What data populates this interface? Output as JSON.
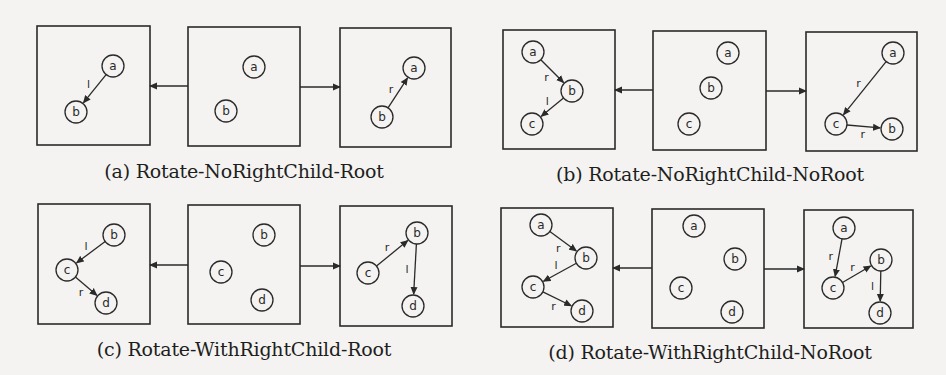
{
  "figure": {
    "colors": {
      "ink": "#2a2a2a",
      "background": "#f4f3f1"
    },
    "subfigures": [
      {
        "id": "a",
        "caption": "(a) Rotate-NoRightChild-Root",
        "caption_pos": [
          244,
          174
        ],
        "panels": [
          {
            "box": [
              37,
              26,
              113,
              119
            ],
            "nodes": [
              {
                "label": "a",
                "x": 113,
                "y": 66
              },
              {
                "label": "b",
                "x": 76,
                "y": 112
              }
            ],
            "edges": [
              {
                "from": "a",
                "to": "b",
                "label": "l"
              }
            ]
          },
          {
            "box": [
              188,
              27,
              112,
              119
            ],
            "nodes": [
              {
                "label": "a",
                "x": 254,
                "y": 67
              },
              {
                "label": "b",
                "x": 226,
                "y": 111
              }
            ],
            "edges": []
          },
          {
            "box": [
              340,
              28,
              111,
              119
            ],
            "nodes": [
              {
                "label": "a",
                "x": 414,
                "y": 68
              },
              {
                "label": "b",
                "x": 382,
                "y": 117
              }
            ],
            "edges": [
              {
                "from": "b",
                "to": "a",
                "label": "r"
              }
            ]
          }
        ],
        "transitions": [
          {
            "x1": 188,
            "x2": 150,
            "y": 86
          },
          {
            "x1": 300,
            "x2": 340,
            "y": 87
          }
        ]
      },
      {
        "id": "b",
        "caption": "(b) Rotate-NoRightChild-NoRoot",
        "caption_pos": [
          710,
          177
        ],
        "panels": [
          {
            "box": [
              503,
              30,
              112,
              119
            ],
            "nodes": [
              {
                "label": "a",
                "x": 533,
                "y": 52
              },
              {
                "label": "b",
                "x": 572,
                "y": 91
              },
              {
                "label": "c",
                "x": 532,
                "y": 124
              }
            ],
            "edges": [
              {
                "from": "a",
                "to": "b",
                "label": "r"
              },
              {
                "from": "b",
                "to": "c",
                "label": "l"
              }
            ]
          },
          {
            "box": [
              653,
              31,
              113,
              119
            ],
            "nodes": [
              {
                "label": "a",
                "x": 728,
                "y": 53
              },
              {
                "label": "b",
                "x": 711,
                "y": 88
              },
              {
                "label": "c",
                "x": 689,
                "y": 124
              }
            ],
            "edges": []
          },
          {
            "box": [
              806,
              32,
              111,
              119
            ],
            "nodes": [
              {
                "label": "a",
                "x": 893,
                "y": 53
              },
              {
                "label": "c",
                "x": 836,
                "y": 124
              },
              {
                "label": "b",
                "x": 892,
                "y": 129
              }
            ],
            "edges": [
              {
                "from": "a",
                "to": "c",
                "label": "r"
              },
              {
                "from": "c",
                "to": "b",
                "label": "r"
              }
            ]
          }
        ],
        "transitions": [
          {
            "x1": 653,
            "x2": 615,
            "y": 90
          },
          {
            "x1": 766,
            "x2": 806,
            "y": 91
          }
        ]
      },
      {
        "id": "c",
        "caption": "(c) Rotate-WithRightChild-Root",
        "caption_pos": [
          244,
          352
        ],
        "panels": [
          {
            "box": [
              38,
              204,
              112,
              120
            ],
            "nodes": [
              {
                "label": "b",
                "x": 114,
                "y": 235
              },
              {
                "label": "c",
                "x": 67,
                "y": 270
              },
              {
                "label": "d",
                "x": 106,
                "y": 303
              }
            ],
            "edges": [
              {
                "from": "b",
                "to": "c",
                "label": "l"
              },
              {
                "from": "c",
                "to": "d",
                "label": "r"
              }
            ]
          },
          {
            "box": [
              188,
              205,
              112,
              119
            ],
            "nodes": [
              {
                "label": "b",
                "x": 264,
                "y": 235
              },
              {
                "label": "c",
                "x": 221,
                "y": 272
              },
              {
                "label": "d",
                "x": 262,
                "y": 300
              }
            ],
            "edges": []
          },
          {
            "box": [
              340,
              206,
              112,
              120
            ],
            "nodes": [
              {
                "label": "b",
                "x": 417,
                "y": 233
              },
              {
                "label": "c",
                "x": 368,
                "y": 273
              },
              {
                "label": "d",
                "x": 413,
                "y": 306
              }
            ],
            "edges": [
              {
                "from": "c",
                "to": "b",
                "label": "r"
              },
              {
                "from": "b",
                "to": "d",
                "label": "l"
              }
            ]
          }
        ],
        "transitions": [
          {
            "x1": 188,
            "x2": 150,
            "y": 265
          },
          {
            "x1": 300,
            "x2": 340,
            "y": 266
          }
        ]
      },
      {
        "id": "d",
        "caption": "(d) Rotate-WithRightChild-NoRoot",
        "caption_pos": [
          710,
          355
        ],
        "panels": [
          {
            "box": [
              501,
              208,
              112,
              119
            ],
            "nodes": [
              {
                "label": "a",
                "x": 541,
                "y": 225
              },
              {
                "label": "b",
                "x": 586,
                "y": 258
              },
              {
                "label": "c",
                "x": 533,
                "y": 287
              },
              {
                "label": "d",
                "x": 582,
                "y": 311
              }
            ],
            "edges": [
              {
                "from": "a",
                "to": "b",
                "label": "r"
              },
              {
                "from": "b",
                "to": "c",
                "label": "l"
              },
              {
                "from": "c",
                "to": "d",
                "label": "r"
              }
            ]
          },
          {
            "box": [
              652,
              209,
              112,
              119
            ],
            "nodes": [
              {
                "label": "a",
                "x": 694,
                "y": 226
              },
              {
                "label": "b",
                "x": 735,
                "y": 259
              },
              {
                "label": "c",
                "x": 681,
                "y": 288
              },
              {
                "label": "d",
                "x": 732,
                "y": 312
              }
            ],
            "edges": []
          },
          {
            "box": [
              804,
              210,
              109,
              118
            ],
            "nodes": [
              {
                "label": "a",
                "x": 844,
                "y": 228
              },
              {
                "label": "c",
                "x": 833,
                "y": 288
              },
              {
                "label": "b",
                "x": 881,
                "y": 260
              },
              {
                "label": "d",
                "x": 880,
                "y": 313
              }
            ],
            "edges": [
              {
                "from": "a",
                "to": "c",
                "label": "r"
              },
              {
                "from": "c",
                "to": "b",
                "label": "r"
              },
              {
                "from": "b",
                "to": "d",
                "label": "l"
              }
            ]
          }
        ],
        "transitions": [
          {
            "x1": 652,
            "x2": 613,
            "y": 268
          },
          {
            "x1": 764,
            "x2": 804,
            "y": 269
          }
        ]
      }
    ]
  }
}
